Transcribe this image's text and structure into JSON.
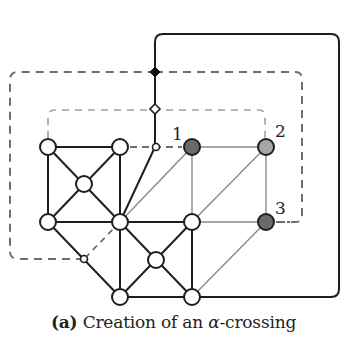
{
  "figure": {
    "caption": {
      "label": "(a)",
      "text_before": "Creation of an ",
      "greek": "α",
      "text_after": "-crossing"
    },
    "node_labels": [
      "1",
      "2",
      "3"
    ],
    "colors": {
      "edge_dark": "#1e1e1e",
      "edge_light": "#8a8a8a",
      "dash_outer": "#6e6e6e",
      "dash_inner": "#a0a0a0",
      "node_fill_white": "#ffffff",
      "node_fill_dark": "#6a6a6a",
      "node_fill_mid": "#a6a6a6",
      "node_fill_black": "#111111"
    },
    "nodes": [
      {
        "id": "a",
        "x": 48,
        "y": 147,
        "kind": "white"
      },
      {
        "id": "b",
        "x": 120,
        "y": 147,
        "kind": "white"
      },
      {
        "id": "c",
        "x": 84,
        "y": 184,
        "kind": "white"
      },
      {
        "id": "d",
        "x": 48,
        "y": 222,
        "kind": "white"
      },
      {
        "id": "e",
        "x": 120,
        "y": 222,
        "kind": "white"
      },
      {
        "id": "f",
        "x": 192,
        "y": 222,
        "kind": "white"
      },
      {
        "id": "g",
        "x": 156,
        "y": 260,
        "kind": "white"
      },
      {
        "id": "h",
        "x": 120,
        "y": 297,
        "kind": "white"
      },
      {
        "id": "i",
        "x": 192,
        "y": 297,
        "kind": "white"
      },
      {
        "id": "n1",
        "x": 192,
        "y": 147,
        "kind": "dark",
        "label": "1"
      },
      {
        "id": "n2",
        "x": 266,
        "y": 147,
        "kind": "mid",
        "label": "2"
      },
      {
        "id": "n3",
        "x": 266,
        "y": 222,
        "kind": "dark",
        "label": "3"
      }
    ]
  }
}
